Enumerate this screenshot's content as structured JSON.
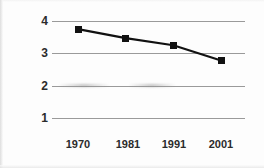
{
  "chart_data": {
    "type": "line",
    "title": "",
    "subtitle": "",
    "xlabel": "",
    "ylabel": "",
    "categories": [
      "1970",
      "1981",
      "1991",
      "2001"
    ],
    "x": [
      1970,
      1981,
      1991,
      2001
    ],
    "values": [
      3.75,
      3.47,
      3.25,
      2.78
    ],
    "series": [
      {
        "name": "",
        "values": [
          3.75,
          3.47,
          3.25,
          2.78
        ],
        "marker": "square",
        "marker_color": "#111111",
        "line_color": "#111111"
      }
    ],
    "ylim": [
      1,
      4
    ],
    "yticks": [
      1,
      2,
      3,
      4
    ],
    "ytick_labels": [
      "1",
      "2",
      "3",
      "4"
    ],
    "xtick_labels": [
      "1970",
      "1981",
      "1991",
      "2001"
    ],
    "grid": "horizontal",
    "grid_color": "#9a9a9a",
    "legend": "none",
    "background": "#fdfdfd",
    "annotations": []
  },
  "axes": {
    "y": [
      {
        "label": "4",
        "value": 4
      },
      {
        "label": "3",
        "value": 3
      },
      {
        "label": "2",
        "value": 2
      },
      {
        "label": "1",
        "value": 1
      }
    ],
    "x": [
      {
        "label": "1970"
      },
      {
        "label": "1981"
      },
      {
        "label": "1991"
      },
      {
        "label": "2001"
      }
    ]
  }
}
